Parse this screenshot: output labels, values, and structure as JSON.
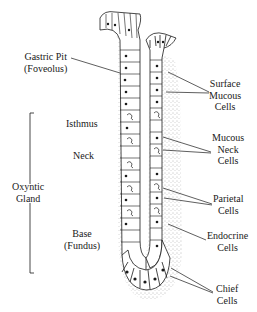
{
  "diagram": {
    "left_labels": {
      "gastric_pit": {
        "line1": "Gastric Pit",
        "line2": "(Foveolus)"
      },
      "isthmus": "Isthmus",
      "neck": "Neck",
      "oxyntic_gland": {
        "line1": "Oxyntic",
        "line2": "Gland"
      },
      "base": {
        "line1": "Base",
        "line2": "(Fundus)"
      }
    },
    "right_labels": {
      "surface_mucous": {
        "line1": "Surface",
        "line2": "Mucous",
        "line3": "Cells"
      },
      "mucous_neck": {
        "line1": "Mucous",
        "line2": "Neck",
        "line3": "Cells"
      },
      "parietal": {
        "line1": "Parietal",
        "line2": "Cells"
      },
      "endocrine": {
        "line1": "Endocrine",
        "line2": "Cells"
      },
      "chief": {
        "line1": "Chief",
        "line2": "Cells"
      }
    },
    "colors": {
      "ink": "#1a1a1a",
      "background": "#ffffff",
      "stipple": "#555555"
    }
  }
}
